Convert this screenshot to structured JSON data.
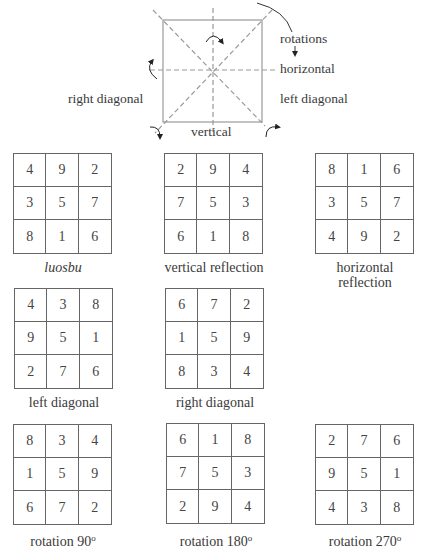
{
  "diagram": {
    "labels": {
      "rotations": "rotations",
      "horizontal": "horizontal",
      "left_diagonal": "left diagonal",
      "right_diagonal": "right diagonal",
      "vertical": "vertical"
    },
    "colors": {
      "line": "#999999",
      "dash": "#999999",
      "arrow": "#222222"
    }
  },
  "squares": [
    {
      "id": "luosbu",
      "caption": "luosbu",
      "italic": true,
      "cells": [
        [
          4,
          9,
          2
        ],
        [
          3,
          5,
          7
        ],
        [
          8,
          1,
          6
        ]
      ]
    },
    {
      "id": "vertical-reflection",
      "caption": "vertical reflection",
      "italic": false,
      "cells": [
        [
          2,
          9,
          4
        ],
        [
          7,
          5,
          3
        ],
        [
          6,
          1,
          8
        ]
      ]
    },
    {
      "id": "horizontal-reflection",
      "caption": "horizontal reflection",
      "caption_line1": "horizontal",
      "caption_line2": "reflection",
      "italic": false,
      "cells": [
        [
          8,
          1,
          6
        ],
        [
          3,
          5,
          7
        ],
        [
          4,
          9,
          2
        ]
      ]
    },
    {
      "id": "left-diagonal",
      "caption": "left diagonal",
      "italic": false,
      "cells": [
        [
          4,
          3,
          8
        ],
        [
          9,
          5,
          1
        ],
        [
          2,
          7,
          6
        ]
      ]
    },
    {
      "id": "right-diagonal",
      "caption": "right diagonal",
      "italic": false,
      "cells": [
        [
          6,
          7,
          2
        ],
        [
          1,
          5,
          9
        ],
        [
          8,
          3,
          4
        ]
      ]
    },
    {
      "id": "rotation-90",
      "caption": "rotation 90",
      "degree": "o",
      "italic": false,
      "cells": [
        [
          8,
          3,
          4
        ],
        [
          1,
          5,
          9
        ],
        [
          6,
          7,
          2
        ]
      ]
    },
    {
      "id": "rotation-180",
      "caption": "rotation 180",
      "degree": "o",
      "italic": false,
      "cells": [
        [
          6,
          1,
          8
        ],
        [
          7,
          5,
          3
        ],
        [
          2,
          9,
          4
        ]
      ]
    },
    {
      "id": "rotation-270",
      "caption": "rotation 270",
      "degree": "o",
      "italic": false,
      "cells": [
        [
          2,
          7,
          6
        ],
        [
          9,
          5,
          1
        ],
        [
          4,
          3,
          8
        ]
      ]
    }
  ]
}
